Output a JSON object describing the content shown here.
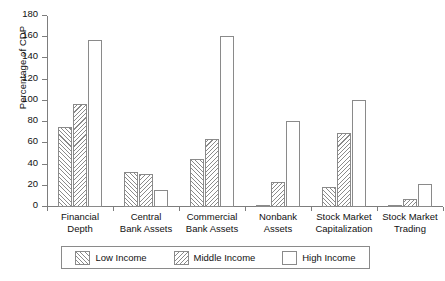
{
  "chart_data": {
    "type": "bar",
    "title": "",
    "xlabel": "",
    "ylabel": "Percentage of CDP",
    "ylim": [
      0,
      180
    ],
    "ytick_step": 20,
    "yticks": [
      0,
      20,
      40,
      60,
      80,
      100,
      120,
      140,
      160,
      180
    ],
    "ytick_labels": [
      "0",
      "20",
      "40",
      "60",
      "80",
      "100",
      "120",
      "140",
      "160",
      "180"
    ],
    "grid": false,
    "legend_position": "bottom",
    "categories": [
      "Financial Depth",
      "Central Bank Assets",
      "Commercial Bank Assets",
      "Nonbank Assets",
      "Stock Market Capitalization",
      "Stock Market Trading"
    ],
    "category_lines": [
      [
        "Financial",
        "Depth"
      ],
      [
        "Central",
        "Bank Assets"
      ],
      [
        "Commercial",
        "Bank Assets"
      ],
      [
        "Nonbank",
        "Assets"
      ],
      [
        "Stock Market",
        "Capitalization"
      ],
      [
        "Stock Market",
        "Trading"
      ]
    ],
    "series": [
      {
        "name": "Low Income",
        "pattern": "forward-diagonal-hatch",
        "values": [
          75,
          33,
          45,
          2,
          19,
          1.5
        ]
      },
      {
        "name": "Middle Income",
        "pattern": "backward-diagonal-hatch",
        "values": [
          97,
          31,
          64,
          24,
          70,
          8
        ]
      },
      {
        "name": "High Income",
        "pattern": "empty",
        "values": [
          157,
          16,
          161,
          81,
          101,
          22
        ]
      }
    ]
  },
  "legend": {
    "entries": [
      {
        "label": "Low Income"
      },
      {
        "label": "Middle Income"
      },
      {
        "label": "High Income"
      }
    ]
  },
  "colors": {
    "axis": "#7d7d7d",
    "bar_outline": "#8a8a8a",
    "hatch": "#8a8a8a",
    "background": "#ffffff",
    "text": "#111111"
  }
}
